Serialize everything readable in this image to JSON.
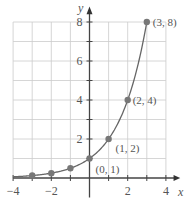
{
  "chart_data": {
    "type": "line",
    "title": "",
    "xlabel": "x",
    "ylabel": "y",
    "xlim": [
      -4,
      4.6
    ],
    "ylim": [
      0,
      8.6
    ],
    "grid": true,
    "x_ticks": [
      -4,
      -2,
      2,
      4
    ],
    "x_tick_labels": [
      "−4",
      "−2",
      "2",
      "4"
    ],
    "y_ticks": [
      2,
      4,
      6,
      8
    ],
    "y_tick_labels": [
      "2",
      "4",
      "6",
      "8"
    ],
    "series": [
      {
        "name": "y = 2^x",
        "function": "2^x",
        "x": [
          -3,
          -2,
          -1,
          0,
          1,
          2,
          3
        ],
        "values": [
          0.125,
          0.25,
          0.5,
          1,
          2,
          4,
          8
        ],
        "color": "#666666",
        "marker_color": "#777777"
      }
    ],
    "annotations": [
      {
        "text": "(0, 1)",
        "x": 0,
        "y": 1
      },
      {
        "text": "(1, 2)",
        "x": 1,
        "y": 2
      },
      {
        "text": "(2, 4)",
        "x": 2,
        "y": 4
      },
      {
        "text": "(3, 8)",
        "x": 3,
        "y": 8
      }
    ]
  }
}
